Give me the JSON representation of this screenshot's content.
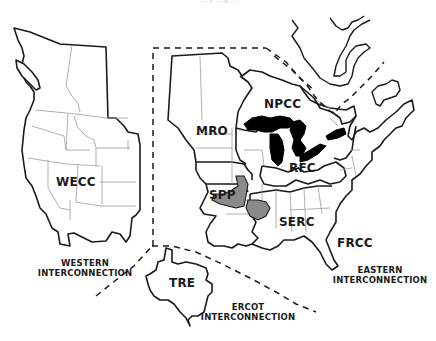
{
  "caption": "... y ... g ...",
  "map": {
    "title": "NERC Interconnections and Regional Entities",
    "background": "#ffffff",
    "land_fill": "#ffffff",
    "border_color": "#1a1a1a",
    "state_line_color": "#9a9a9a",
    "great_lakes_color": "#000000",
    "spp_serc_overlap_color": "#8a8a8a"
  },
  "regions": [
    {
      "id": "WECC",
      "label": "WECC"
    },
    {
      "id": "MRO",
      "label": "MRO"
    },
    {
      "id": "NPCC",
      "label": "NPCC"
    },
    {
      "id": "RFC",
      "label": "RFC"
    },
    {
      "id": "SPP",
      "label": "SPP"
    },
    {
      "id": "SERC",
      "label": "SERC"
    },
    {
      "id": "FRCC",
      "label": "FRCC"
    },
    {
      "id": "TRE",
      "label": "TRE"
    }
  ],
  "interconnections": {
    "western": {
      "line1": "WESTERN",
      "line2": "INTERCONNECTION"
    },
    "eastern": {
      "line1": "EASTERN",
      "line2": "INTERCONNECTION"
    },
    "ercot": {
      "line1": "ERCOT",
      "line2": "INTERCONNECTION"
    }
  }
}
